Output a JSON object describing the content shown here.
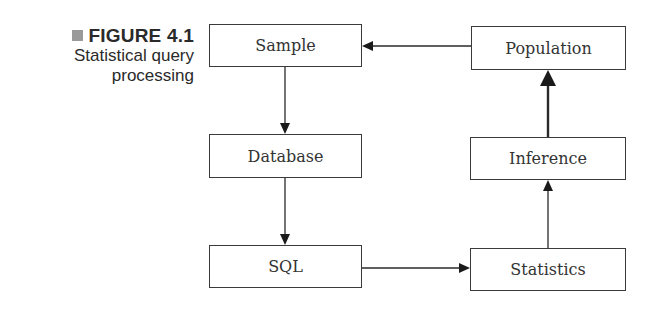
{
  "caption": {
    "figure_label": "FIGURE 4.1",
    "title_line1": "Statistical query",
    "title_line2": "processing",
    "marker_color": "#9a9a9a"
  },
  "diagram": {
    "nodes": [
      {
        "id": "sample",
        "label": "Sample"
      },
      {
        "id": "database",
        "label": "Database"
      },
      {
        "id": "sql",
        "label": "SQL"
      },
      {
        "id": "statistics",
        "label": "Statistics"
      },
      {
        "id": "inference",
        "label": "Inference"
      },
      {
        "id": "population",
        "label": "Population"
      }
    ],
    "edges": [
      {
        "from": "population",
        "to": "sample"
      },
      {
        "from": "sample",
        "to": "database"
      },
      {
        "from": "database",
        "to": "sql"
      },
      {
        "from": "sql",
        "to": "statistics"
      },
      {
        "from": "statistics",
        "to": "inference"
      },
      {
        "from": "inference",
        "to": "population",
        "style": "bold"
      }
    ]
  }
}
